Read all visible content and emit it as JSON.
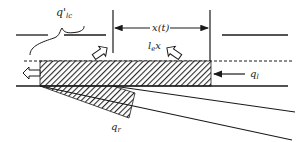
{
  "diagram": {
    "labels": {
      "q_lc": "q'",
      "q_lc_sub": "lc",
      "x_t": "x(t)",
      "l_e": "l",
      "l_e_sub": "e",
      "l_e_x": "x",
      "q_l": "q",
      "q_l_sub": "l",
      "q_r": "q",
      "q_r_sub": "r"
    },
    "colors": {
      "stroke": "#1a1a1a",
      "hatch": "#2a2a2a",
      "background": "#ffffff"
    }
  }
}
